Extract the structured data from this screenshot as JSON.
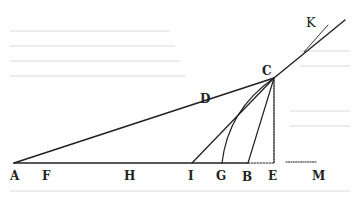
{
  "figure": {
    "colors": {
      "ink": "#222222",
      "paper": "#ffffff",
      "bleed_through": "#ececec"
    },
    "points": {
      "A": {
        "x": 14,
        "y": 163
      },
      "F": {
        "x": 44,
        "y": 163
      },
      "H": {
        "x": 128,
        "y": 163
      },
      "I": {
        "x": 192,
        "y": 163
      },
      "G": {
        "x": 222,
        "y": 163
      },
      "B": {
        "x": 248,
        "y": 163
      },
      "E": {
        "x": 274,
        "y": 163
      },
      "M": {
        "x": 316,
        "y": 163
      },
      "C": {
        "x": 274,
        "y": 78
      },
      "D": {
        "x": 205,
        "y": 101
      },
      "K": {
        "x": 328,
        "y": 25
      }
    },
    "labels": [
      {
        "id": "A",
        "text": "A",
        "x": 10,
        "y": 180
      },
      {
        "id": "F",
        "text": "F",
        "x": 42,
        "y": 180
      },
      {
        "id": "H",
        "text": "H",
        "x": 124,
        "y": 180
      },
      {
        "id": "I",
        "text": "I",
        "x": 188,
        "y": 180
      },
      {
        "id": "G",
        "text": "G",
        "x": 216,
        "y": 180
      },
      {
        "id": "B",
        "text": "B",
        "x": 242,
        "y": 181
      },
      {
        "id": "E",
        "text": "E",
        "x": 268,
        "y": 180
      },
      {
        "id": "M",
        "text": "M",
        "x": 312,
        "y": 180
      },
      {
        "id": "C",
        "text": "C",
        "x": 262,
        "y": 75
      },
      {
        "id": "D",
        "text": "D",
        "x": 200,
        "y": 103
      },
      {
        "id": "K",
        "text": "K",
        "x": 306,
        "y": 27
      }
    ]
  }
}
